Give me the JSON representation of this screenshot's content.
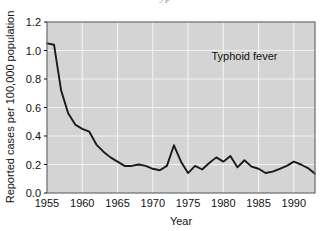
{
  "figure": {
    "partial_caption_top": "yp",
    "plot_background_color": "#d4d4d4",
    "line_color": "#1a1a1a",
    "grid_color": "#f2f2f2",
    "frame_color": "#6b6b6b"
  },
  "chart_data": {
    "type": "line",
    "title": "",
    "subtitle": "",
    "xlabel": "Year",
    "ylabel": "Reported cases per 100,000 population",
    "xlim": [
      1955,
      1993
    ],
    "ylim": [
      0.0,
      1.2
    ],
    "xticks": [
      1955,
      1960,
      1965,
      1970,
      1975,
      1980,
      1985,
      1990
    ],
    "xticklabels": [
      "1955",
      "1960",
      "1965",
      "1970",
      "1975",
      "1980",
      "1985",
      "1990"
    ],
    "yticks": [
      0.0,
      0.2,
      0.4,
      0.6,
      0.8,
      1.0,
      1.2
    ],
    "yticklabels": [
      "0.0",
      "0.2",
      "0.4",
      "0.6",
      "0.8",
      "1.0",
      "1.2"
    ],
    "grid": true,
    "legend": "none",
    "annotations": [
      {
        "text": "Typhoid fever",
        "x": 1983.0,
        "y": 0.93
      }
    ],
    "series": [
      {
        "name": "Typhoid fever",
        "x": [
          1955,
          1956,
          1957,
          1958,
          1959,
          1960,
          1961,
          1962,
          1963,
          1964,
          1965,
          1966,
          1967,
          1968,
          1969,
          1970,
          1971,
          1972,
          1973,
          1974,
          1975,
          1976,
          1977,
          1978,
          1979,
          1980,
          1981,
          1982,
          1983,
          1984,
          1985,
          1986,
          1987,
          1988,
          1989,
          1990,
          1991,
          1992,
          1993
        ],
        "values": [
          1.05,
          1.04,
          0.72,
          0.56,
          0.48,
          0.45,
          0.43,
          0.34,
          0.29,
          0.25,
          0.22,
          0.19,
          0.19,
          0.2,
          0.19,
          0.17,
          0.16,
          0.19,
          0.335,
          0.22,
          0.14,
          0.19,
          0.165,
          0.21,
          0.25,
          0.22,
          0.26,
          0.18,
          0.23,
          0.185,
          0.17,
          0.14,
          0.15,
          0.17,
          0.19,
          0.22,
          0.2,
          0.175,
          0.135
        ]
      }
    ]
  }
}
